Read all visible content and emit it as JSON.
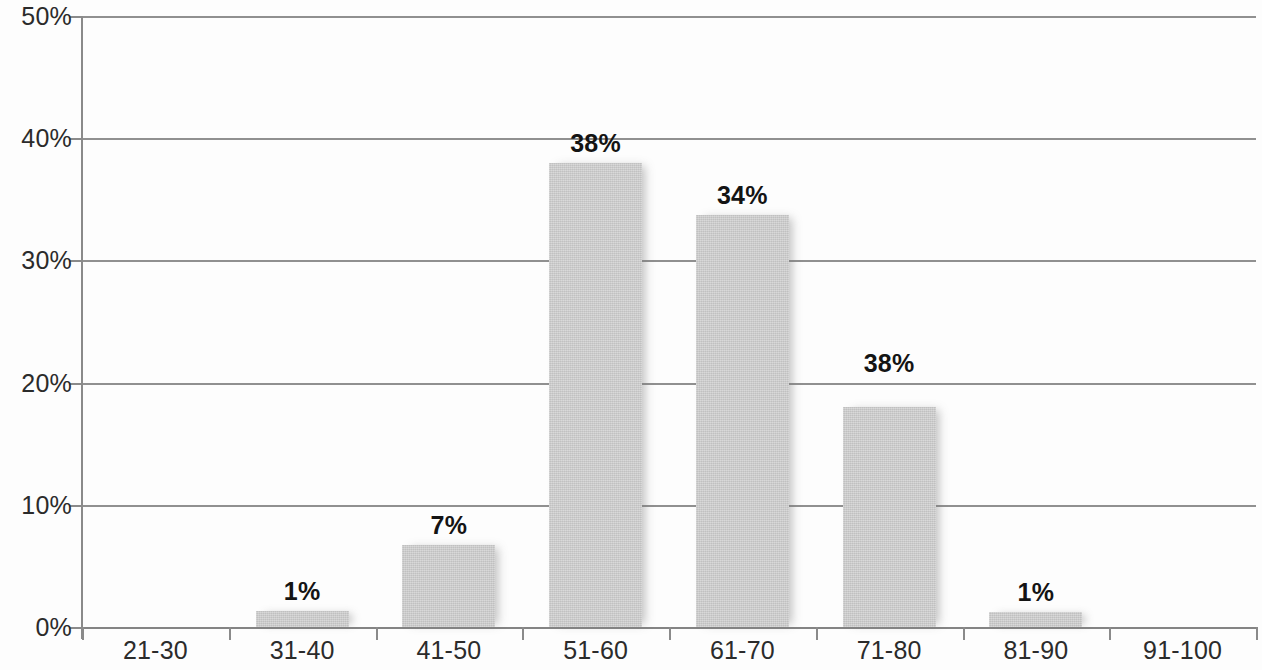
{
  "chart_data": {
    "type": "bar",
    "title": "",
    "subtitle": "",
    "xlabel": "",
    "ylabel": "",
    "categories": [
      "21-30",
      "31-40",
      "41-50",
      "51-60",
      "61-70",
      "71-80",
      "81-90",
      "91-100"
    ],
    "values": [
      0,
      1.3,
      6.7,
      38.0,
      33.7,
      18.0,
      1.2,
      0
    ],
    "data_labels": [
      "",
      "1%",
      "7%",
      "38%",
      "34%",
      "38%",
      "1%",
      ""
    ],
    "ylim": [
      0,
      50
    ],
    "y_ticks": [
      0,
      10,
      20,
      30,
      40,
      50
    ],
    "y_tick_labels": [
      "0%",
      "10%",
      "20%",
      "30%",
      "40%",
      "50%"
    ],
    "grid": true,
    "grid_axis": "y",
    "legend": false,
    "legend_position": "none",
    "bar_color": "#c9c9c9",
    "axis_color": "#8a8a8a",
    "grid_color": "#7d7d7d",
    "label_color": "#141414",
    "tick_label_color": "#2b2b2b"
  }
}
